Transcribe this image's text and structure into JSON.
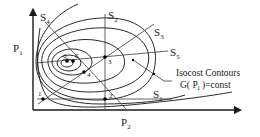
{
  "diagram": {
    "axes": {
      "y_label": "P",
      "y_sub": "1",
      "x_label": "P",
      "x_sub": "2"
    },
    "search_lines": [
      {
        "id": "S1",
        "label": "S",
        "sub": "1"
      },
      {
        "id": "S2",
        "label": "S",
        "sub": "2"
      },
      {
        "id": "S3",
        "label": "S",
        "sub": "3"
      },
      {
        "id": "S4",
        "label": "S",
        "sub": "4"
      },
      {
        "id": "S5",
        "label": "S",
        "sub": "5"
      }
    ],
    "points": [
      {
        "id": "1",
        "label": "1"
      },
      {
        "id": "2",
        "label": "2"
      },
      {
        "id": "3",
        "label": "3"
      },
      {
        "id": "4",
        "label": "4"
      },
      {
        "id": "5",
        "label": "5"
      },
      {
        "id": "6",
        "label": "6"
      }
    ],
    "annotation": {
      "line1": "Isocost Contours",
      "line2_pre": "G( P",
      "line2_sub": "i",
      "line2_post": " )=const"
    },
    "colors": {
      "ink": "#1a1a1a",
      "background": "#ffffff"
    }
  }
}
